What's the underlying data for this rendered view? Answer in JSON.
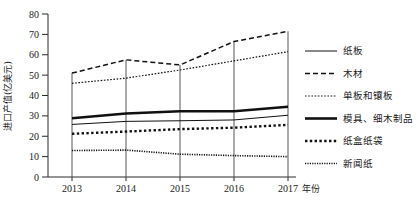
{
  "chart_data": {
    "type": "line",
    "title": "",
    "xlabel": "年份",
    "ylabel": "进口产值(亿美元)",
    "categories": [
      "2013",
      "2014",
      "2015",
      "2016",
      "2017"
    ],
    "x": [
      2013,
      2014,
      2015,
      2016,
      2017
    ],
    "ylim": [
      0,
      80
    ],
    "yticks": [
      "0",
      "10",
      "20",
      "30",
      "40",
      "50",
      "60",
      "70",
      "80"
    ],
    "ytick_values": [
      0,
      10,
      20,
      30,
      40,
      50,
      60,
      70,
      80
    ],
    "grid": false,
    "legend_position": "right",
    "series": [
      {
        "name": "纸板",
        "style": "solid-thin",
        "values": [
          25.8,
          27.3,
          27.6,
          28.0,
          30.3
        ]
      },
      {
        "name": "木材",
        "style": "dashed",
        "values": [
          51.0,
          57.5,
          55.0,
          66.5,
          71.5
        ]
      },
      {
        "name": "单板和镶板",
        "style": "dotted-fine",
        "values": [
          46.0,
          48.5,
          52.5,
          57.0,
          61.5
        ]
      },
      {
        "name": "模具、细木制品",
        "style": "solid-thick",
        "values": [
          28.8,
          31.2,
          32.3,
          32.3,
          34.5
        ]
      },
      {
        "name": "纸盒纸袋",
        "style": "dotted-thick",
        "values": [
          21.2,
          22.3,
          23.5,
          24.2,
          25.6
        ]
      },
      {
        "name": "新闻纸",
        "style": "dotted-veryfine",
        "values": [
          13.0,
          13.2,
          11.2,
          10.5,
          10.0
        ]
      }
    ]
  },
  "legend": {
    "items": [
      {
        "label": "纸板"
      },
      {
        "label": "木材"
      },
      {
        "label": "单板和镶板"
      },
      {
        "label": "模具、细木制品"
      },
      {
        "label": "纸盒纸袋"
      },
      {
        "label": "新闻纸"
      }
    ]
  },
  "axes": {
    "y_title": "进口产值(亿美元)",
    "x_title": "年份"
  }
}
